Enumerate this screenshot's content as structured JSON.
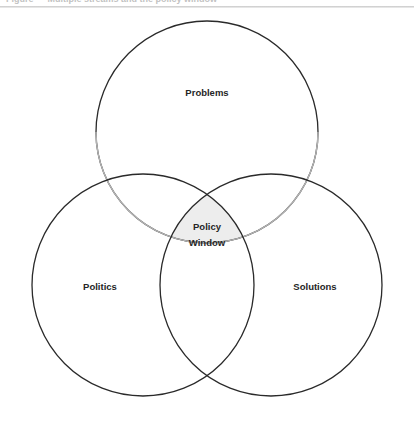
{
  "page": {
    "background_color": "#ffffff",
    "width": 414,
    "height": 424
  },
  "caption": {
    "clipped_text": "Figure — Multiple streams and the policy window",
    "note": "top line of text is cut off by the crop; only descender pixels visible"
  },
  "header_rule": {
    "color": "#d0d0d0"
  },
  "diagram": {
    "type": "venn-3-circle",
    "stroke_dark": "#2a2a2a",
    "stroke_light": "#b3b3b3",
    "stroke_width": 1.3,
    "intersection_fill": "#ededed",
    "circle_fill": "none",
    "circles": [
      {
        "id": "problems",
        "label": "Problems",
        "cx": 207,
        "cy": 132,
        "r": 111,
        "label_x": 207,
        "label_y": 93,
        "stroke": "#2a2a2a"
      },
      {
        "id": "politics",
        "label": "Politics",
        "cx": 143,
        "cy": 285,
        "r": 111,
        "label_x": 100,
        "label_y": 287,
        "stroke": "#2a2a2a"
      },
      {
        "id": "solutions",
        "label": "Solutions",
        "cx": 271,
        "cy": 285,
        "r": 111,
        "label_x": 315,
        "label_y": 287,
        "stroke": "#2a2a2a"
      }
    ],
    "center_region": {
      "id": "policy-window",
      "label_line_1": "Policy",
      "label_line_2": "Window",
      "label_x": 207,
      "label_y": 222,
      "fill": "#ededed"
    }
  }
}
